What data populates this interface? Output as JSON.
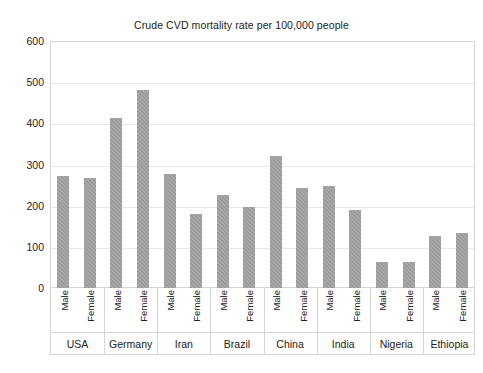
{
  "chart_data": {
    "type": "bar",
    "title": "Crude CVD mortality rate per 100,000 people",
    "xlabel": "",
    "ylabel": "",
    "ylim": [
      0,
      600
    ],
    "y_ticks": [
      0,
      100,
      200,
      300,
      400,
      500,
      600
    ],
    "grid": true,
    "legend": "none",
    "categories": [
      "USA",
      "Germany",
      "Iran",
      "Brazil",
      "China",
      "India",
      "Nigeria",
      "Ethiopia"
    ],
    "subcategories": [
      "Male",
      "Female"
    ],
    "series": [
      {
        "name": "Male",
        "values": [
          271,
          412,
          278,
          225,
          321,
          248,
          63,
          126
        ]
      },
      {
        "name": "Female",
        "values": [
          268,
          482,
          180,
          197,
          243,
          190,
          64,
          134
        ]
      }
    ],
    "bar_color": "#9b9b9b",
    "grid_color": "#e9e9e9",
    "frame_color": "#d6d6d6",
    "background": "#ffffff"
  }
}
